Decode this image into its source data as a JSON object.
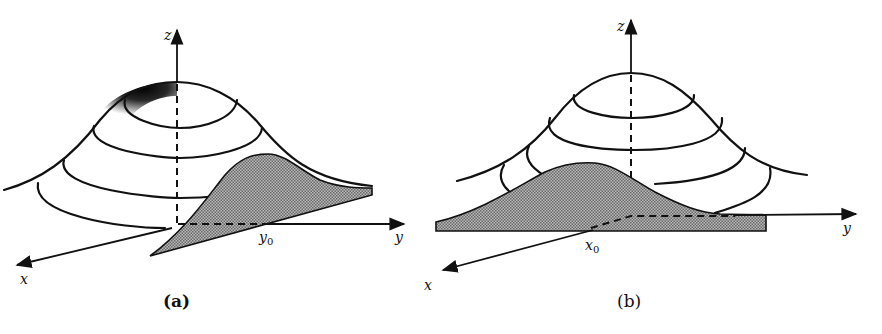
{
  "figure": {
    "colors": {
      "ink": "#111111",
      "slice_fill": "#9a9a9a",
      "background": "#ffffff"
    },
    "panels": [
      {
        "id": "a",
        "caption": "(a)",
        "axes": {
          "x": "x",
          "y": "y",
          "z": "z"
        },
        "slice_label": "y",
        "slice_label_sub": "0",
        "slice_description": "Shaded slice taken at y = y0, parallel to the x–z plane",
        "contour_rings": 4,
        "shaded_cap": true
      },
      {
        "id": "b",
        "caption": "(b)",
        "axes": {
          "x": "x",
          "y": "y",
          "z": "z"
        },
        "slice_label": "x",
        "slice_label_sub": "0",
        "slice_description": "Shaded slice taken at x = x0, parallel to the y–z plane",
        "contour_rings": 4,
        "shaded_cap": false
      }
    ]
  }
}
